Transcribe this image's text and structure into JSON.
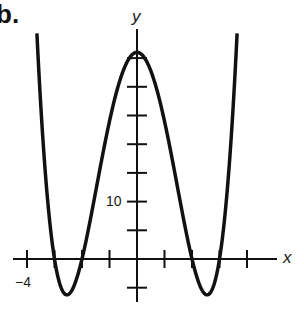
{
  "figure": {
    "part_label": "b."
  },
  "chart_data": {
    "type": "line",
    "title": "",
    "xlabel": "x",
    "ylabel": "y",
    "function": "y = (x^2 - 4)(x^2 - 9) = x^4 - 13x^2 + 36",
    "x_ticks": [
      -4,
      -3,
      -2,
      -1,
      0,
      1,
      2,
      3,
      4
    ],
    "x_tick_labels_shown": [
      {
        "value": -4,
        "label": "−4"
      }
    ],
    "y_ticks": [
      -5,
      5,
      10,
      15,
      20,
      25,
      30,
      35
    ],
    "y_tick_labels_shown": [
      {
        "value": 10,
        "label": "10"
      }
    ],
    "xlim": [
      -4.5,
      5.1
    ],
    "ylim": [
      -7,
      40
    ],
    "grid": false,
    "legend": null,
    "key_points": {
      "x_intercepts": [
        -3,
        -2,
        2,
        3
      ],
      "y_intercept": 36,
      "local_max": {
        "x": 0,
        "y": 36
      },
      "local_mins": [
        {
          "x": -2.55,
          "y": -6.25
        },
        {
          "x": 2.55,
          "y": -6.25
        }
      ]
    },
    "series": [
      {
        "name": "f(x)",
        "x": [
          -3.65,
          -3.5,
          -3.25,
          -3.0,
          -2.75,
          -2.55,
          -2.25,
          -2.0,
          -1.75,
          -1.5,
          -1.0,
          -0.5,
          0,
          0.5,
          1.0,
          1.5,
          1.75,
          2.0,
          2.25,
          2.55,
          2.75,
          3.0,
          3.25,
          3.5,
          3.65
        ],
        "values": [
          39.9,
          26.8,
          10.2,
          0,
          -5.13,
          -6.25,
          -4.18,
          0,
          5.57,
          11.81,
          24.0,
          32.81,
          36,
          32.81,
          24.0,
          11.81,
          5.57,
          0,
          -4.18,
          -6.25,
          -5.13,
          0,
          10.2,
          26.8,
          39.9
        ]
      }
    ],
    "axis_labels": {
      "x": "x",
      "y": "y"
    },
    "style": {
      "line_color": "#111111",
      "axis_color": "#111111",
      "background": "#ffffff"
    }
  }
}
